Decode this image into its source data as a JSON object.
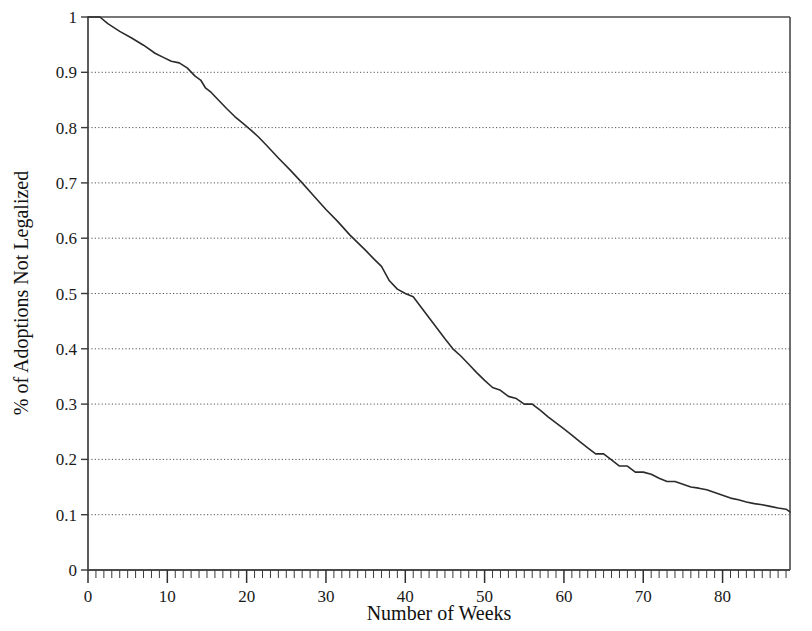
{
  "chart_data": {
    "type": "line",
    "title": "",
    "subtitle": "",
    "xlabel": "Number of Weeks",
    "ylabel": "% of Adoptions Not Legalized",
    "xlim": [
      0,
      88.5
    ],
    "ylim": [
      0,
      1
    ],
    "grid": "horizontal-dotted",
    "legend": "none",
    "x_major_ticks": [
      0,
      10,
      20,
      30,
      40,
      50,
      60,
      70,
      80
    ],
    "x_major_tick_labels": [
      "0",
      "10",
      "20",
      "30",
      "40",
      "50",
      "60",
      "70",
      "80"
    ],
    "x_minor_tick_step": 1,
    "y_ticks": [
      0,
      0.1,
      0.2,
      0.3,
      0.4,
      0.5,
      0.6,
      0.7,
      0.8,
      0.9,
      1
    ],
    "y_tick_labels": [
      "0",
      "0.1",
      "0.2",
      "0.3",
      "0.4",
      "0.5",
      "0.6",
      "0.7",
      "0.8",
      "0.9",
      "1"
    ],
    "series": [
      {
        "name": "% of Adoptions Not Legalized",
        "color": "#2b2b2b",
        "line_width": 1.6,
        "x": [
          0,
          1.5,
          2.5,
          4,
          5.5,
          7,
          8.5,
          9.5,
          10.5,
          11.5,
          12.5,
          13.5,
          14.2,
          14.8,
          15.5,
          16.5,
          17.5,
          18.5,
          19.5,
          20.5,
          21.5,
          22.5,
          24,
          25.5,
          27,
          28.5,
          30,
          31.5,
          33,
          34,
          35,
          36,
          37,
          38,
          39,
          40,
          41,
          42,
          43,
          44,
          45,
          46,
          47,
          48,
          49,
          50,
          51,
          52,
          53,
          54,
          55,
          56,
          57,
          58,
          59,
          60,
          61,
          62,
          63,
          64,
          65,
          66,
          67,
          68,
          69,
          70,
          71,
          72,
          73,
          74,
          75,
          76,
          77,
          78,
          79,
          80,
          81,
          82,
          83,
          84,
          85,
          86,
          87,
          88,
          88.5
        ],
        "y": [
          1,
          1,
          0.988,
          0.974,
          0.962,
          0.949,
          0.934,
          0.927,
          0.92,
          0.917,
          0.908,
          0.893,
          0.886,
          0.872,
          0.864,
          0.849,
          0.834,
          0.82,
          0.808,
          0.796,
          0.783,
          0.768,
          0.745,
          0.723,
          0.7,
          0.676,
          0.652,
          0.63,
          0.606,
          0.592,
          0.578,
          0.563,
          0.549,
          0.523,
          0.508,
          0.5,
          0.494,
          0.475,
          0.456,
          0.437,
          0.418,
          0.4,
          0.387,
          0.372,
          0.357,
          0.343,
          0.33,
          0.325,
          0.314,
          0.31,
          0.3,
          0.3,
          0.289,
          0.277,
          0.266,
          0.255,
          0.244,
          0.232,
          0.221,
          0.21,
          0.21,
          0.199,
          0.188,
          0.188,
          0.177,
          0.177,
          0.173,
          0.166,
          0.16,
          0.16,
          0.155,
          0.15,
          0.148,
          0.145,
          0.14,
          0.135,
          0.13,
          0.127,
          0.123,
          0.12,
          0.118,
          0.115,
          0.112,
          0.11,
          0.105
        ]
      }
    ],
    "annotations": []
  },
  "axes": {
    "x_title": "Number of Weeks",
    "y_title": "% of Adoptions Not Legalized"
  }
}
